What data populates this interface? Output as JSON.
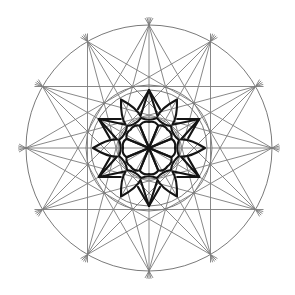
{
  "diagram": {
    "title": "",
    "type": "geometric-construction",
    "center": [
      149,
      148
    ],
    "colors": {
      "background": "#ffffff",
      "construction_line": "#7a7a7a",
      "ink_line": "#141414"
    },
    "outer_circle": {
      "radius": 123,
      "divisions": 12
    },
    "construction_chords": [
      {
        "name": "twelve-five-star",
        "step": 5
      },
      {
        "name": "four-triangles",
        "step": 4
      },
      {
        "name": "diameters",
        "step": 6
      }
    ],
    "construction_circles": [
      {
        "name": "middle-circle-outer",
        "radius": 63
      },
      {
        "name": "middle-circle-inner",
        "radius": 58
      },
      {
        "name": "inner-circle",
        "radius": 31
      }
    ],
    "star": {
      "points": 12,
      "tip_radius": 58,
      "hexagram_tips_deg": [
        30,
        90,
        150,
        210,
        270,
        330
      ],
      "petal_tips_deg": [
        0,
        60,
        120,
        180,
        240,
        300
      ]
    },
    "rosette": {
      "petals": 8,
      "radius": 26
    }
  }
}
